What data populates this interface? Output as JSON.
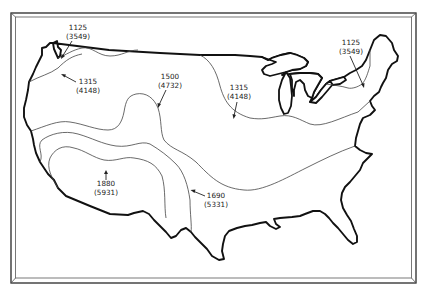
{
  "map": {
    "subject": "United States outline with isoline contours",
    "contour_labels": [
      {
        "id": "nw-1125",
        "value": "1125",
        "alt_value": "(3549)"
      },
      {
        "id": "nw-1315",
        "value": "1315",
        "alt_value": "(4148)"
      },
      {
        "id": "central-1500",
        "value": "1500",
        "alt_value": "(4732)"
      },
      {
        "id": "midwest-1315",
        "value": "1315",
        "alt_value": "(4148)"
      },
      {
        "id": "ne-1125",
        "value": "1125",
        "alt_value": "(3549)"
      },
      {
        "id": "sw-1880",
        "value": "1880",
        "alt_value": "(5931)"
      },
      {
        "id": "south-1690",
        "value": "1690",
        "alt_value": "(5331)"
      }
    ],
    "colors": {
      "background": "#ffffff",
      "outline": "#111111",
      "contour": "#444444"
    }
  }
}
